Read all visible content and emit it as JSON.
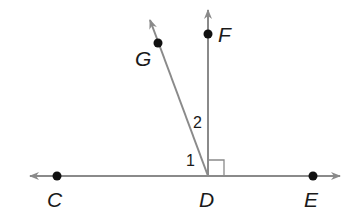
{
  "diagram": {
    "type": "geometry-angles",
    "points": {
      "C": {
        "label": "C"
      },
      "D": {
        "label": "D"
      },
      "E": {
        "label": "E"
      },
      "F": {
        "label": "F"
      },
      "G": {
        "label": "G"
      }
    },
    "angles": {
      "angle1": {
        "label": "1"
      },
      "angle2": {
        "label": "2"
      }
    },
    "line_color": "#8a8a8a",
    "point_color": "#111111",
    "right_angle_marker": "FDE"
  }
}
